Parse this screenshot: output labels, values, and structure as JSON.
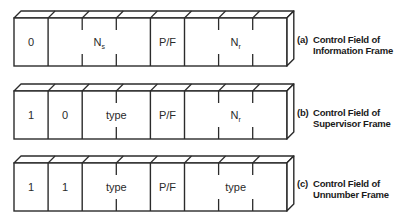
{
  "diagram": {
    "stroke_color": "#2b2b2b",
    "background": "#ffffff",
    "rows": [
      {
        "id": "a",
        "tag": "(a)",
        "caption_line1": "Control Field of",
        "caption_line2": "Information Frame",
        "fields": [
          {
            "label": "0",
            "sub": "",
            "bits": 1
          },
          {
            "label": "N",
            "sub": "s",
            "bits": 3
          },
          {
            "label": "P/F",
            "sub": "",
            "bits": 1
          },
          {
            "label": "N",
            "sub": "r",
            "bits": 3
          }
        ]
      },
      {
        "id": "b",
        "tag": "(b)",
        "caption_line1": "Control Field of",
        "caption_line2": "Supervisor Frame",
        "fields": [
          {
            "label": "1",
            "sub": "",
            "bits": 1
          },
          {
            "label": "0",
            "sub": "",
            "bits": 1
          },
          {
            "label": "type",
            "sub": "",
            "bits": 2
          },
          {
            "label": "P/F",
            "sub": "",
            "bits": 1
          },
          {
            "label": "N",
            "sub": "r",
            "bits": 3
          }
        ]
      },
      {
        "id": "c",
        "tag": "(c)",
        "caption_line1": "Control Field of",
        "caption_line2": "Unnumber Frame",
        "fields": [
          {
            "label": "1",
            "sub": "",
            "bits": 1
          },
          {
            "label": "1",
            "sub": "",
            "bits": 1
          },
          {
            "label": "type",
            "sub": "",
            "bits": 2
          },
          {
            "label": "P/F",
            "sub": "",
            "bits": 1
          },
          {
            "label": "type",
            "sub": "",
            "bits": 3
          }
        ]
      }
    ]
  }
}
